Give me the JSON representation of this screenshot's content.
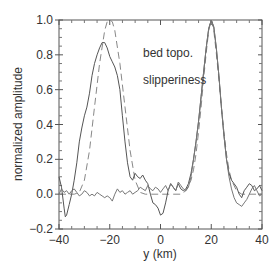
{
  "chart_data": {
    "type": "line",
    "title": "",
    "xlabel": "y (km)",
    "ylabel": "normalized amplitude",
    "xlim": [
      -40,
      40
    ],
    "ylim": [
      -0.2,
      1.0
    ],
    "grid": false,
    "x_ticks": [
      -40,
      -20,
      0,
      20,
      40
    ],
    "x_tick_labels": [
      "−40",
      "−20",
      "0",
      "20",
      "40"
    ],
    "y_ticks": [
      -0.2,
      0.0,
      0.2,
      0.4,
      0.6,
      0.8,
      1.0
    ],
    "y_tick_labels": [
      "−0.2",
      "0.0",
      "0.2",
      "0.4",
      "0.6",
      "0.8",
      "1.0"
    ],
    "annotations": [
      {
        "text": "bed topo.",
        "x": -4,
        "y": 0.8
      },
      {
        "text": "slipperiness",
        "x": -4,
        "y": 0.63
      }
    ],
    "series": [
      {
        "name": "true (dashed)",
        "style": "dashed",
        "color": "#888888",
        "x": [
          -40,
          -34,
          -32,
          -30,
          -28,
          -26,
          -24,
          -22,
          -21,
          -20,
          -19,
          -18,
          -16,
          -14,
          -12,
          -10,
          -8,
          -6,
          -4,
          0,
          4,
          8,
          10,
          12,
          13,
          14,
          15,
          16,
          17,
          18,
          19,
          20,
          21,
          22,
          23,
          24,
          25,
          26,
          27,
          28,
          30,
          32,
          34,
          40
        ],
        "values": [
          0,
          0,
          0.01,
          0.08,
          0.25,
          0.5,
          0.75,
          0.94,
          0.99,
          1.0,
          0.99,
          0.94,
          0.75,
          0.5,
          0.25,
          0.08,
          0.01,
          0,
          0,
          0,
          0,
          0,
          0.02,
          0.08,
          0.14,
          0.23,
          0.36,
          0.5,
          0.66,
          0.81,
          0.94,
          1.0,
          0.94,
          0.81,
          0.66,
          0.5,
          0.36,
          0.23,
          0.14,
          0.08,
          0.02,
          0,
          0,
          0
        ]
      },
      {
        "name": "bed topo.",
        "style": "solid",
        "color": "#555555",
        "x": [
          -40,
          -39,
          -38,
          -37.5,
          -37,
          -36,
          -35,
          -34,
          -33,
          -32,
          -31,
          -30,
          -29,
          -28,
          -27,
          -26,
          -25,
          -24,
          -23,
          -22,
          -21,
          -20,
          -19,
          -18,
          -17,
          -16,
          -15,
          -14,
          -13,
          -12,
          -11,
          -10,
          -9,
          -8,
          -7,
          -6,
          -5,
          -4,
          -3,
          -2,
          -1,
          0,
          1,
          2,
          3,
          4,
          5,
          6,
          7,
          8,
          9,
          10,
          11,
          12,
          13,
          14,
          15,
          16,
          17,
          18,
          19,
          20,
          21,
          22,
          23,
          24,
          25,
          26,
          27,
          28,
          29,
          30,
          31,
          32,
          33,
          34,
          35,
          36,
          37,
          38,
          39,
          40
        ],
        "values": [
          0.1,
          0.04,
          -0.08,
          -0.13,
          -0.12,
          -0.06,
          0.0,
          0.08,
          0.18,
          0.3,
          0.38,
          0.45,
          0.5,
          0.58,
          0.68,
          0.75,
          0.8,
          0.84,
          0.87,
          0.87,
          0.84,
          0.79,
          0.76,
          0.73,
          0.68,
          0.6,
          0.45,
          0.3,
          0.18,
          0.1,
          0.08,
          0.12,
          0.1,
          0.09,
          0.11,
          0.08,
          0.06,
          0.0,
          -0.05,
          -0.06,
          -0.08,
          -0.12,
          -0.11,
          -0.05,
          0.02,
          0.06,
          0.04,
          0.02,
          0.06,
          0.03,
          0.02,
          0.03,
          0.06,
          0.12,
          0.2,
          0.3,
          0.42,
          0.56,
          0.7,
          0.84,
          0.95,
          1.0,
          0.96,
          0.84,
          0.68,
          0.5,
          0.34,
          0.2,
          0.12,
          0.08,
          0.06,
          0.04,
          0.0,
          -0.02,
          0.02,
          0.04,
          0.06,
          0.05,
          0.02,
          0.03,
          0.05,
          0.02
        ]
      },
      {
        "name": "slipperiness",
        "style": "solid",
        "color": "#777777",
        "x": [
          -40,
          -39,
          -38,
          -37,
          -36,
          -35,
          -34,
          -33,
          -32,
          -31,
          -30,
          -29,
          -28,
          -27,
          -26,
          -25,
          -24,
          -23,
          -22,
          -21,
          -20,
          -19,
          -18,
          -17,
          -16,
          -15,
          -14,
          -13,
          -12,
          -11,
          -10,
          -9,
          -8,
          -7,
          -6,
          -5,
          -4,
          -3,
          -2,
          -1,
          0,
          1,
          2,
          3,
          4,
          5,
          6,
          7,
          8,
          9,
          10,
          11,
          12,
          13,
          14,
          15,
          16,
          17,
          18,
          19,
          20,
          21,
          22,
          23,
          24,
          25,
          26,
          27,
          28,
          29,
          30,
          31,
          32,
          33,
          34,
          35,
          36,
          37,
          38,
          39,
          40
        ],
        "values": [
          0.0,
          0.03,
          0.01,
          0.02,
          0.0,
          0.02,
          0.03,
          0.01,
          -0.01,
          0.0,
          0.02,
          0.01,
          -0.01,
          0.0,
          -0.01,
          0.01,
          0.0,
          -0.01,
          -0.02,
          -0.01,
          -0.02,
          -0.04,
          0.0,
          0.03,
          0.01,
          0.02,
          0.0,
          0.01,
          0.02,
          0.0,
          0.01,
          0.02,
          0.04,
          0.03,
          0.02,
          0.05,
          0.03,
          0.02,
          0.04,
          0.03,
          0.01,
          0.03,
          0.05,
          0.02,
          0.06,
          0.04,
          0.02,
          0.07,
          0.05,
          0.03,
          0.02,
          0.04,
          0.1,
          0.2,
          0.3,
          0.42,
          0.56,
          0.7,
          0.84,
          0.95,
          1.0,
          0.96,
          0.84,
          0.68,
          0.5,
          0.34,
          0.2,
          0.1,
          0.03,
          -0.02,
          -0.05,
          -0.06,
          -0.07,
          -0.05,
          -0.03,
          0.0,
          0.03,
          0.05,
          0.02,
          -0.01,
          0.0
        ]
      }
    ]
  }
}
